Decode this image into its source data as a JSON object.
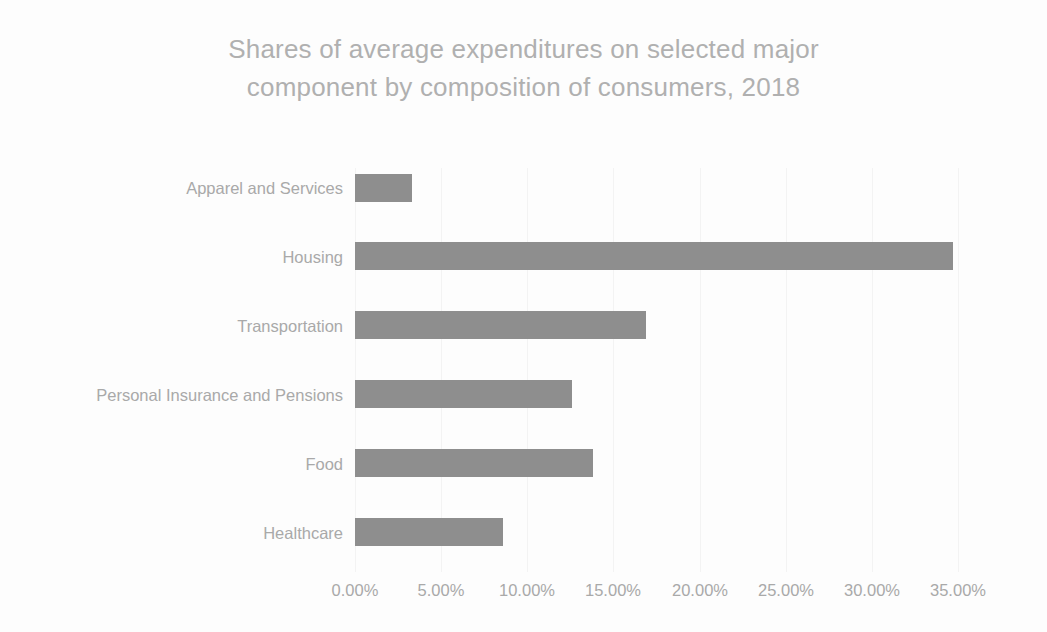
{
  "chart_data": {
    "type": "bar",
    "orientation": "horizontal",
    "title": "Shares of average expenditures on selected major\ncomponent by composition of consumers, 2018",
    "title_line1": "Shares of average expenditures on selected major",
    "title_line2": "component by composition of consumers, 2018",
    "categories": [
      "Apparel and Services",
      "Housing",
      "Transportation",
      "Personal Insurance and Pensions",
      "Food",
      "Healthcare"
    ],
    "values": [
      3.3,
      34.7,
      16.9,
      12.6,
      13.8,
      8.6
    ],
    "value_unit": "percent",
    "xlabel": "",
    "ylabel": "",
    "xlim": [
      0,
      35
    ],
    "x_tick_labels": [
      "0.00%",
      "5.00%",
      "10.00%",
      "15.00%",
      "20.00%",
      "25.00%",
      "30.00%",
      "35.00%"
    ],
    "x_tick_values": [
      0,
      5,
      10,
      15,
      20,
      25,
      30,
      35
    ],
    "grid": "light-vertical",
    "legend": "none",
    "series": [
      {
        "name": "Share of average expenditures",
        "values": [
          3.3,
          34.7,
          16.9,
          12.6,
          13.8,
          8.6
        ]
      }
    ],
    "colors": {
      "bar": "#8e8e8e",
      "title_text": "#b0b0b0",
      "axis_text": "#a9a9a9",
      "background": "#fdfdfd",
      "gridline": "#f3f3f3"
    }
  }
}
